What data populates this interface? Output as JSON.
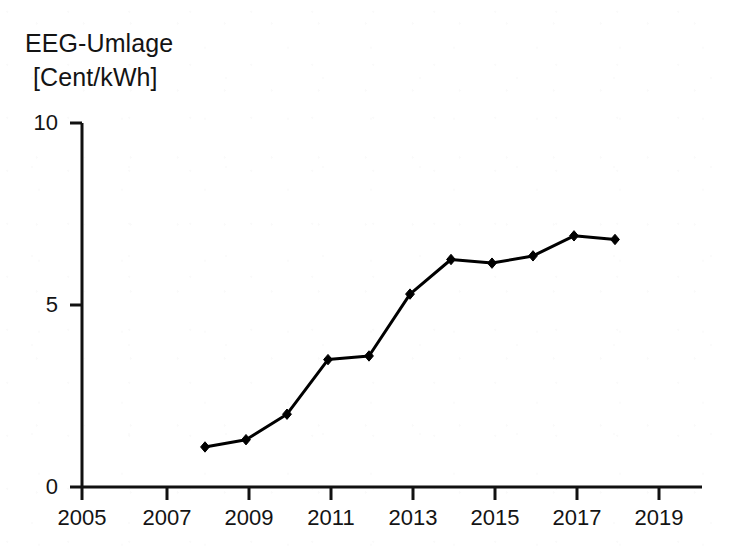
{
  "chart_data": {
    "type": "line",
    "title": "EEG-Umlage [Cent/kWh]",
    "title_lines": [
      "EEG-Umlage",
      "[Cent/kWh]"
    ],
    "xlabel": "",
    "ylabel": "EEG-Umlage [Cent/kWh]",
    "x": [
      2008,
      2009,
      2010,
      2011,
      2012,
      2013,
      2014,
      2015,
      2016,
      2017,
      2018
    ],
    "values": [
      1.1,
      1.3,
      2.0,
      3.5,
      3.6,
      5.3,
      6.25,
      6.15,
      6.35,
      6.9,
      6.8
    ],
    "series": [
      {
        "name": "EEG-Umlage",
        "values": [
          1.1,
          1.3,
          2.0,
          3.5,
          3.6,
          5.3,
          6.25,
          6.15,
          6.35,
          6.9,
          6.8
        ]
      }
    ],
    "xlim": [
      2005,
      2020
    ],
    "ylim": [
      0,
      10
    ],
    "xticks": [
      2005,
      2007,
      2009,
      2011,
      2013,
      2015,
      2017,
      2019
    ],
    "xtick_labels": [
      "2005",
      "2007",
      "2009",
      "2011",
      "2013",
      "2015",
      "2017",
      "2019"
    ],
    "yticks": [
      0,
      5,
      10
    ],
    "ytick_labels": [
      "0",
      "5",
      "10"
    ],
    "grid": false,
    "legend": false,
    "marker": "diamond",
    "line_color": "#000000",
    "marker_color": "#000000",
    "background_color": "#ffffff"
  },
  "axes": {
    "y_axis_label_top": "10",
    "y_axis_label_mid": "5",
    "y_axis_label_zero": "0"
  }
}
